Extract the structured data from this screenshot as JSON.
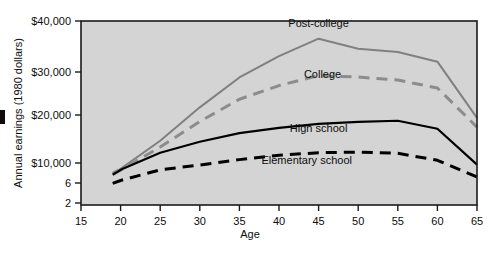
{
  "chart_data": {
    "type": "line",
    "title": "",
    "subtitle": "",
    "xlabel": "Age",
    "ylabel": "Annual earnings (1980 dollars)",
    "xlim": [
      15,
      65
    ],
    "ylim": [
      2000,
      40000
    ],
    "yscale": "log-like (compressed low end)",
    "grid": false,
    "legend_position": "inline-annotations",
    "background": "#d4d4d4",
    "frame_color": "#1a1a1a",
    "x_ticks": [
      15,
      20,
      25,
      30,
      35,
      40,
      45,
      50,
      55,
      60,
      65
    ],
    "x_tick_labels": [
      "15",
      "20",
      "25",
      "30",
      "35",
      "40",
      "45",
      "50",
      "55",
      "60",
      "65"
    ],
    "y_ticks": [
      40000,
      30000,
      20000,
      10000,
      6000,
      2000
    ],
    "y_tick_labels": [
      "$40,000",
      "$30,000",
      "$20,000",
      "$10,000",
      "6",
      "2"
    ],
    "x": [
      19,
      20,
      25,
      30,
      35,
      40,
      45,
      50,
      55,
      60,
      65
    ],
    "series": [
      {
        "name": "Post-college",
        "label": "Post-college",
        "color": "#808080",
        "style": "solid",
        "width": 2,
        "values": [
          7800,
          8600,
          13800,
          21500,
          28500,
          32800,
          36200,
          34200,
          33600,
          31800,
          19200
        ]
      },
      {
        "name": "College",
        "label": "College",
        "color": "#8c8c8c",
        "style": "dashed",
        "width": 3,
        "values": [
          7500,
          8300,
          12600,
          18200,
          23200,
          26400,
          29000,
          28600,
          27800,
          25800,
          16800
        ]
      },
      {
        "name": "High school",
        "label": "High school",
        "color": "#000000",
        "style": "solid",
        "width": 2.2,
        "values": [
          7400,
          8400,
          11600,
          13600,
          15400,
          16600,
          17600,
          18100,
          18400,
          16400,
          9600
        ]
      },
      {
        "name": "Elementary school",
        "label": "Elementary school",
        "color": "#000000",
        "style": "dashed",
        "width": 3,
        "values": [
          5900,
          6400,
          8400,
          9500,
          10500,
          11200,
          11600,
          11700,
          11500,
          10400,
          7000
        ]
      }
    ],
    "annotations": [
      {
        "text": "Post-college",
        "x": 45.0,
        "y_px": 27,
        "series": "Post-college"
      },
      {
        "text": "College",
        "x": 45.5,
        "y_px": 78,
        "series": "College"
      },
      {
        "text": "High school",
        "x": 45.0,
        "y_px": 132,
        "series": "High school"
      },
      {
        "text": "Elementary school",
        "x": 43.5,
        "y_px": 164,
        "series": "Elementary school"
      }
    ]
  }
}
